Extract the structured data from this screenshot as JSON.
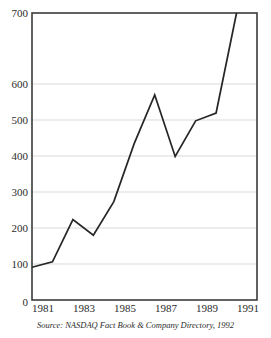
{
  "chart_data": {
    "type": "line",
    "title": "",
    "xlabel": "",
    "ylabel": "",
    "x": [
      1981,
      1982,
      1983,
      1984,
      1985,
      1986,
      1987,
      1988,
      1989,
      1990,
      1991
    ],
    "values": [
      80,
      93,
      196,
      158,
      240,
      382,
      500,
      350,
      437,
      456,
      700
    ],
    "series": [
      {
        "name": "NASDAQ",
        "values": [
          80,
          93,
          196,
          158,
          240,
          382,
          500,
          350,
          437,
          456,
          700
        ]
      }
    ],
    "xlim": [
      1981,
      1992
    ],
    "ylim": [
      0,
      700
    ],
    "ytick_labels": [
      "0",
      "100",
      "200",
      "300",
      "400",
      "500",
      "600",
      "700"
    ],
    "ytick_values": [
      0,
      100,
      200,
      300,
      400,
      500,
      600,
      700
    ],
    "xtick_labels": [
      "1981",
      "1983",
      "1985",
      "1987",
      "1989",
      "1991"
    ],
    "xtick_values": [
      1981,
      1983,
      1985,
      1987,
      1989,
      1991
    ],
    "grid": "horizontal",
    "legend": "none",
    "line_color": "#262626",
    "grid_color": "#c9c9c9",
    "frame_color": "#3b3b3b"
  },
  "caption": {
    "source_note": "Source: NASDAQ Fact Book & Company Directory, 1992"
  },
  "header": {
    "clipped_title": ""
  }
}
